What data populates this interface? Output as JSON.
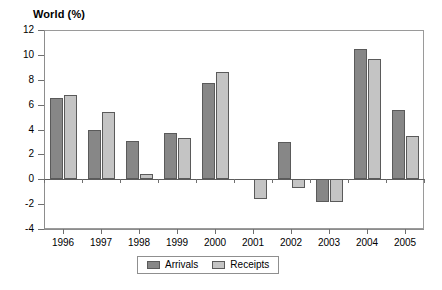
{
  "chart_data": {
    "type": "bar",
    "title": "World (%)",
    "xlabel": "",
    "ylabel": "",
    "ylim": [
      -4,
      12
    ],
    "ytick_step": 2,
    "yticks": [
      12,
      10,
      8,
      6,
      4,
      2,
      0,
      -2,
      -4
    ],
    "ytick_labels": [
      "12",
      "10",
      "8",
      "6",
      "4",
      "2",
      "0",
      "-2",
      "-4"
    ],
    "grid": false,
    "legend_position": "bottom-center",
    "categories": [
      "1996",
      "1997",
      "1998",
      "1999",
      "2000",
      "2001",
      "2002",
      "2003",
      "2004",
      "2005"
    ],
    "series": [
      {
        "name": "Arrivals",
        "color": "#878787",
        "values": [
          6.5,
          4.0,
          3.1,
          3.7,
          7.7,
          0.0,
          3.0,
          -1.8,
          10.5,
          5.6
        ]
      },
      {
        "name": "Receipts",
        "color": "#c4c4c4",
        "values": [
          6.75,
          5.4,
          0.4,
          3.3,
          8.6,
          -1.6,
          -0.7,
          -1.8,
          9.7,
          3.5
        ]
      }
    ]
  },
  "colors": {
    "arrivals": "#878787",
    "receipts": "#c4c4c4",
    "bar_border": "#5a5a5a",
    "axis": "#8d8d8d",
    "background": "#ffffff"
  }
}
